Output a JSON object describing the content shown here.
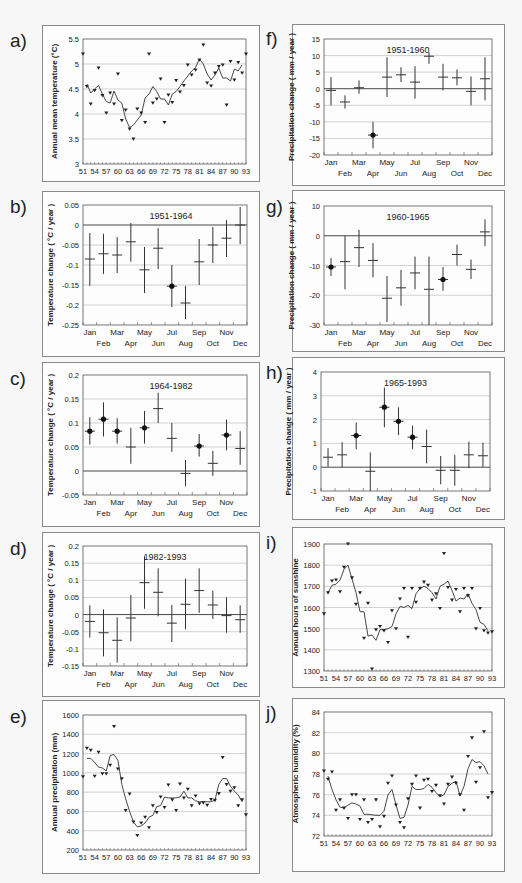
{
  "panel_labels": [
    "a)",
    "b)",
    "c)",
    "d)",
    "e)",
    "f)",
    "g)",
    "h)",
    "i)",
    "j)"
  ],
  "chart_data": [
    {
      "id": "a",
      "type": "scatter+line",
      "title": "",
      "xlabel": "",
      "ylabel": "Annual mean temperature (°C)",
      "ylim": [
        3,
        5.5
      ],
      "yticks": [
        3,
        3.5,
        4,
        4.5,
        5,
        5.5
      ],
      "xticks": [
        "51",
        "54",
        "57",
        "60",
        "63",
        "66",
        "69",
        "72",
        "75",
        "78",
        "81",
        "84",
        "87",
        "90",
        "93"
      ],
      "x": [
        51,
        52,
        53,
        54,
        55,
        56,
        57,
        58,
        59,
        60,
        61,
        62,
        63,
        64,
        65,
        66,
        67,
        68,
        69,
        70,
        71,
        72,
        73,
        74,
        75,
        76,
        77,
        78,
        79,
        80,
        81,
        82,
        83,
        84,
        85,
        86,
        87,
        88,
        89,
        90,
        91,
        92,
        93
      ],
      "points": [
        5.2,
        4.55,
        4.2,
        4.47,
        4.92,
        4.37,
        4.02,
        4.42,
        4.2,
        4.8,
        3.87,
        4.08,
        3.7,
        3.5,
        4.1,
        4.02,
        3.83,
        5.2,
        4.22,
        4.3,
        4.7,
        3.83,
        4.38,
        4.23,
        4.67,
        4.44,
        4.57,
        4.98,
        4.78,
        4.88,
        5.08,
        5.38,
        4.62,
        4.56,
        4.82,
        4.95,
        4.98,
        4.18,
        5.05,
        4.68,
        5.03,
        4.82,
        5.2
      ],
      "smooth": [
        null,
        4.6,
        4.42,
        4.5,
        4.57,
        4.4,
        4.25,
        4.22,
        4.46,
        4.28,
        4.22,
        3.9,
        3.73,
        3.78,
        3.88,
        3.98,
        4.32,
        4.4,
        4.55,
        4.45,
        4.3,
        4.3,
        4.18,
        4.4,
        4.45,
        4.55,
        4.66,
        4.76,
        4.86,
        4.93,
        5.1,
        5.0,
        4.8,
        4.68,
        4.78,
        4.92,
        4.72,
        4.72,
        4.66,
        4.9,
        4.86,
        4.98,
        null
      ],
      "grid": true
    },
    {
      "id": "b",
      "type": "errorbar",
      "title": "1951-1964",
      "ylabel": "Temperature change ( °C / year )",
      "ylim": [
        -0.25,
        0.05
      ],
      "yticks": [
        -0.25,
        -0.2,
        -0.15,
        -0.1,
        -0.05,
        0,
        0.05
      ],
      "categories": [
        "Jan",
        "Feb",
        "Mar",
        "Apr",
        "May",
        "Jun",
        "Jul",
        "Aug",
        "Sep",
        "Oct",
        "Nov",
        "Dec"
      ],
      "values": [
        -0.085,
        -0.072,
        -0.075,
        -0.042,
        -0.112,
        -0.058,
        -0.153,
        -0.195,
        -0.092,
        -0.05,
        -0.033,
        0.0
      ],
      "low": [
        -0.152,
        -0.122,
        -0.12,
        -0.092,
        -0.17,
        -0.11,
        -0.205,
        -0.235,
        -0.15,
        -0.095,
        -0.08,
        -0.048
      ],
      "high": [
        -0.02,
        -0.022,
        -0.03,
        0.005,
        -0.055,
        -0.008,
        -0.1,
        -0.152,
        -0.035,
        -0.005,
        0.012,
        0.045
      ],
      "significant": [
        false,
        false,
        false,
        false,
        false,
        false,
        true,
        false,
        false,
        false,
        false,
        false
      ],
      "grid": true
    },
    {
      "id": "c",
      "type": "errorbar",
      "title": "1964-1982",
      "ylabel": "Temperature change ( °C / year )",
      "ylim": [
        -0.05,
        0.2
      ],
      "yticks": [
        -0.05,
        0,
        0.05,
        0.1,
        0.15,
        0.2
      ],
      "categories": [
        "Jan",
        "Feb",
        "Mar",
        "Apr",
        "May",
        "Jun",
        "Jul",
        "Aug",
        "Sep",
        "Oct",
        "Nov",
        "Dec"
      ],
      "values": [
        0.083,
        0.108,
        0.083,
        0.05,
        0.09,
        0.13,
        0.068,
        -0.005,
        0.052,
        0.016,
        0.075,
        0.047
      ],
      "low": [
        0.055,
        0.072,
        0.057,
        0.015,
        0.057,
        0.1,
        0.04,
        -0.032,
        0.03,
        -0.01,
        0.043,
        0.013
      ],
      "high": [
        0.112,
        0.143,
        0.11,
        0.09,
        0.125,
        0.163,
        0.1,
        0.023,
        0.077,
        0.042,
        0.107,
        0.083
      ],
      "significant": [
        true,
        true,
        true,
        false,
        true,
        false,
        false,
        false,
        true,
        false,
        true,
        false
      ],
      "grid": true
    },
    {
      "id": "d",
      "type": "errorbar",
      "title": "1982-1993",
      "ylabel": "Temperature change ( °C / year )",
      "ylim": [
        -0.15,
        0.2
      ],
      "yticks": [
        -0.15,
        -0.1,
        -0.05,
        0,
        0.05,
        0.1,
        0.15,
        0.2
      ],
      "categories": [
        "Jan",
        "Feb",
        "Mar",
        "Apr",
        "May",
        "Jun",
        "Jul",
        "Aug",
        "Sep",
        "Oct",
        "Nov",
        "Dec"
      ],
      "values": [
        -0.02,
        -0.053,
        -0.075,
        -0.01,
        0.093,
        0.065,
        -0.025,
        0.03,
        0.07,
        0.028,
        -0.003,
        -0.015
      ],
      "low": [
        -0.067,
        -0.122,
        -0.14,
        -0.078,
        0.017,
        -0.005,
        -0.08,
        -0.043,
        0.005,
        -0.013,
        -0.053,
        -0.053
      ],
      "high": [
        0.027,
        0.015,
        -0.008,
        0.057,
        0.17,
        0.135,
        0.028,
        0.105,
        0.135,
        0.07,
        0.05,
        0.027
      ],
      "significant": [
        false,
        false,
        false,
        false,
        false,
        false,
        false,
        false,
        false,
        false,
        false,
        false
      ],
      "grid": true
    },
    {
      "id": "e",
      "type": "scatter+line",
      "ylabel": "Annual precipitation (mm)",
      "ylim": [
        200,
        1600
      ],
      "yticks": [
        200,
        400,
        600,
        800,
        1000,
        1200,
        1400,
        1600
      ],
      "xticks": [
        "51",
        "54",
        "57",
        "60",
        "63",
        "66",
        "69",
        "72",
        "75",
        "78",
        "81",
        "84",
        "87",
        "90",
        "93"
      ],
      "x": [
        51,
        52,
        53,
        54,
        55,
        56,
        57,
        58,
        59,
        60,
        61,
        62,
        63,
        64,
        65,
        66,
        67,
        68,
        69,
        70,
        71,
        72,
        73,
        74,
        75,
        76,
        77,
        78,
        79,
        80,
        81,
        82,
        83,
        84,
        85,
        86,
        87,
        88,
        89,
        90,
        91,
        92,
        93
      ],
      "points": [
        960,
        1255,
        1235,
        965,
        1215,
        990,
        990,
        1080,
        1480,
        1040,
        940,
        610,
        780,
        490,
        350,
        480,
        540,
        430,
        660,
        590,
        750,
        640,
        875,
        720,
        610,
        885,
        740,
        830,
        660,
        760,
        680,
        690,
        665,
        725,
        715,
        785,
        1160,
        880,
        810,
        845,
        660,
        720,
        565
      ],
      "smooth": [
        null,
        1150,
        1150,
        1110,
        1060,
        1050,
        1020,
        1180,
        1190,
        1130,
        880,
        730,
        600,
        490,
        440,
        450,
        480,
        540,
        560,
        650,
        660,
        750,
        740,
        740,
        740,
        750,
        810,
        740,
        740,
        710,
        700,
        700,
        700,
        700,
        720,
        880,
        940,
        940,
        860,
        810,
        770,
        700,
        null
      ],
      "grid": true
    },
    {
      "id": "f",
      "type": "errorbar",
      "title": "1951-1960",
      "ylabel": "Precipitation change ( mm / year )",
      "ylim": [
        -20,
        15
      ],
      "yticks": [
        -20,
        -15,
        -10,
        -5,
        0,
        5,
        10,
        15
      ],
      "categories": [
        "Jan",
        "Feb",
        "Mar",
        "Apr",
        "May",
        "Jun",
        "Jul",
        "Aug",
        "Sep",
        "Oct",
        "Nov",
        "Dec"
      ],
      "values": [
        -0.5,
        -4,
        0.3,
        -14,
        3.5,
        4.2,
        2,
        9.8,
        3.5,
        3.3,
        -0.8,
        3
      ],
      "low": [
        -5,
        -6,
        -1.5,
        -18,
        -2.5,
        2,
        -3,
        7.5,
        -0.5,
        1,
        -5,
        -3.5
      ],
      "high": [
        3.5,
        -2,
        2.5,
        -10,
        9.5,
        6.5,
        6.8,
        11,
        7.5,
        5.8,
        3.7,
        9.5
      ],
      "significant": [
        false,
        false,
        false,
        true,
        false,
        false,
        false,
        false,
        false,
        false,
        false,
        false
      ],
      "grid": true
    },
    {
      "id": "g",
      "type": "errorbar",
      "title": "1960-1965",
      "ylabel": "Precipitation change ( mm / year )",
      "ylim": [
        -30,
        10
      ],
      "yticks": [
        -30,
        -20,
        -10,
        0,
        10
      ],
      "categories": [
        "Jan",
        "Feb",
        "Mar",
        "Apr",
        "May",
        "Jun",
        "Jul",
        "Aug",
        "Sep",
        "Oct",
        "Nov",
        "Dec"
      ],
      "values": [
        -10.5,
        -8.7,
        -4,
        -8.3,
        -21,
        -17.5,
        -12.5,
        -18,
        -14.7,
        -6.3,
        -11.3,
        1.3
      ],
      "low": [
        -13.5,
        -18,
        -10.5,
        -14,
        -29,
        -23.5,
        -18,
        -30,
        -18.5,
        -10,
        -14.5,
        -3.5
      ],
      "high": [
        -7.5,
        0,
        2,
        -2.5,
        -13.5,
        -11.5,
        -7,
        -7,
        -10.5,
        -3,
        -8,
        5.5
      ],
      "significant": [
        true,
        false,
        false,
        false,
        false,
        false,
        false,
        false,
        true,
        false,
        false,
        false
      ],
      "grid": true
    },
    {
      "id": "h",
      "type": "errorbar",
      "title": "1965-1993",
      "ylabel": "Precipitation change ( mm / year )",
      "ylim": [
        -1,
        4
      ],
      "yticks": [
        -1,
        0,
        1,
        2,
        3,
        4
      ],
      "categories": [
        "Jan",
        "Feb",
        "Mar",
        "Apr",
        "May",
        "Jun",
        "Jul",
        "Aug",
        "Sep",
        "Oct",
        "Nov",
        "Dec"
      ],
      "values": [
        0.42,
        0.52,
        1.33,
        -0.17,
        2.52,
        1.93,
        1.26,
        0.87,
        -0.13,
        -0.13,
        0.52,
        0.48
      ],
      "low": [
        0.02,
        0.0,
        0.75,
        -1.0,
        1.68,
        1.35,
        0.76,
        0.16,
        -0.72,
        -0.78,
        -0.04,
        0.02
      ],
      "high": [
        0.8,
        1.05,
        1.88,
        0.62,
        3.35,
        2.52,
        1.75,
        1.58,
        0.47,
        0.52,
        1.07,
        1.03
      ],
      "significant": [
        false,
        false,
        true,
        false,
        true,
        true,
        true,
        false,
        false,
        false,
        false,
        false
      ],
      "grid": true
    },
    {
      "id": "i",
      "type": "scatter+line",
      "ylabel": "Annual hours of sunshine",
      "ylim": [
        1300,
        1900
      ],
      "yticks": [
        1300,
        1400,
        1500,
        1600,
        1700,
        1800,
        1900
      ],
      "xticks": [
        "51",
        "54",
        "57",
        "60",
        "63",
        "66",
        "69",
        "72",
        "75",
        "78",
        "81",
        "84",
        "87",
        "90",
        "93"
      ],
      "x": [
        51,
        52,
        53,
        54,
        55,
        56,
        57,
        58,
        59,
        60,
        61,
        62,
        63,
        64,
        65,
        66,
        67,
        68,
        69,
        70,
        71,
        72,
        73,
        74,
        75,
        76,
        77,
        78,
        79,
        80,
        81,
        82,
        83,
        84,
        85,
        86,
        87,
        88,
        89,
        90,
        91,
        92,
        93
      ],
      "points": [
        1570,
        1670,
        1725,
        1730,
        1675,
        1790,
        1900,
        1740,
        1615,
        1670,
        1455,
        1620,
        1310,
        1495,
        1510,
        1490,
        1435,
        1585,
        1500,
        1640,
        1690,
        1460,
        1690,
        1625,
        1690,
        1720,
        1705,
        1635,
        1665,
        1595,
        1855,
        1695,
        1635,
        1685,
        1580,
        1690,
        1655,
        1690,
        1500,
        1595,
        1490,
        1480,
        1485
      ],
      "smooth": [
        null,
        1670,
        1705,
        1710,
        1730,
        1780,
        1800,
        1735,
        1670,
        1580,
        1580,
        1465,
        1470,
        1445,
        1495,
        1495,
        1500,
        1510,
        1570,
        1605,
        1600,
        1610,
        1595,
        1665,
        1690,
        1700,
        1690,
        1670,
        1640,
        1700,
        1710,
        1725,
        1680,
        1630,
        1645,
        1640,
        1665,
        1620,
        1590,
        1530,
        1520,
        1490,
        null
      ],
      "grid": true
    },
    {
      "id": "j",
      "type": "scatter+line",
      "ylabel": "Atmospheric humidity (%)",
      "ylim": [
        72,
        84
      ],
      "yticks": [
        72,
        74,
        76,
        78,
        80,
        82,
        84
      ],
      "xticks": [
        "51",
        "54",
        "57",
        "60",
        "63",
        "66",
        "69",
        "72",
        "75",
        "78",
        "81",
        "84",
        "87",
        "90",
        "93"
      ],
      "x": [
        51,
        52,
        53,
        54,
        55,
        56,
        57,
        58,
        59,
        60,
        61,
        62,
        63,
        64,
        65,
        66,
        67,
        68,
        69,
        70,
        71,
        72,
        73,
        74,
        75,
        76,
        77,
        78,
        79,
        80,
        81,
        82,
        83,
        84,
        85,
        86,
        87,
        88,
        89,
        90,
        91,
        92,
        93
      ],
      "points": [
        78.3,
        77.5,
        78.2,
        74.5,
        75.5,
        74.7,
        73.7,
        76,
        76,
        73.6,
        75.5,
        73.3,
        73.6,
        75.5,
        72.9,
        73.9,
        77.1,
        77.8,
        75,
        73.3,
        72.8,
        75.6,
        77,
        77.8,
        74.7,
        77.4,
        77.5,
        76.3,
        76.9,
        75.9,
        75.1,
        77,
        77.7,
        77.1,
        76,
        74.5,
        79.7,
        81.5,
        77.2,
        78.6,
        82.1,
        75.7,
        76.2
      ],
      "smooth": [
        null,
        77.8,
        76.5,
        75.5,
        74.8,
        74.7,
        75,
        75.2,
        75.1,
        74.9,
        74.1,
        74.1,
        74.05,
        74.0,
        74.0,
        74.4,
        76,
        76.5,
        75,
        73.7,
        73.8,
        75,
        76.8,
        76.5,
        76.5,
        76.6,
        77,
        76.7,
        76.2,
        75.8,
        76,
        76.8,
        77.1,
        77.3,
        75.9,
        76.8,
        78.5,
        79.4,
        79.1,
        79.2,
        78.8,
        78,
        null
      ],
      "grid": true
    }
  ],
  "layout": {
    "frames": [
      {
        "id": "a",
        "x": 42,
        "y": 25,
        "w": 218,
        "h": 157,
        "label_x": 10,
        "label_y": 48
      },
      {
        "id": "b",
        "x": 42,
        "y": 191,
        "w": 218,
        "h": 166,
        "label_x": 10,
        "label_y": 214
      },
      {
        "id": "c",
        "x": 42,
        "y": 362,
        "w": 218,
        "h": 165,
        "label_x": 10,
        "label_y": 386
      },
      {
        "id": "d",
        "x": 42,
        "y": 532,
        "w": 218,
        "h": 165,
        "label_x": 10,
        "label_y": 556
      },
      {
        "id": "e",
        "x": 42,
        "y": 700,
        "w": 218,
        "h": 174,
        "label_x": 10,
        "label_y": 724
      },
      {
        "id": "f",
        "x": 292,
        "y": 24,
        "w": 213,
        "h": 162,
        "label_x": 266,
        "label_y": 46
      },
      {
        "id": "g",
        "x": 292,
        "y": 190,
        "w": 213,
        "h": 162,
        "label_x": 266,
        "label_y": 214
      },
      {
        "id": "h",
        "x": 292,
        "y": 357,
        "w": 213,
        "h": 163,
        "label_x": 266,
        "label_y": 380
      },
      {
        "id": "i",
        "x": 292,
        "y": 527,
        "w": 213,
        "h": 161,
        "label_x": 266,
        "label_y": 550
      },
      {
        "id": "j",
        "x": 292,
        "y": 698,
        "w": 213,
        "h": 174,
        "label_x": 266,
        "label_y": 720
      }
    ],
    "plots": {
      "a": {
        "x": 83,
        "y": 39,
        "w": 163,
        "h": 125
      },
      "b": {
        "x": 83,
        "y": 205,
        "w": 164,
        "h": 120
      },
      "c": {
        "x": 83,
        "y": 375,
        "w": 164,
        "h": 120
      },
      "d": {
        "x": 83,
        "y": 546,
        "w": 164,
        "h": 120
      },
      "e": {
        "x": 83,
        "y": 715,
        "w": 163,
        "h": 135
      },
      "f": {
        "x": 324,
        "y": 39,
        "w": 168,
        "h": 116
      },
      "g": {
        "x": 324,
        "y": 206,
        "w": 168,
        "h": 119
      },
      "h": {
        "x": 321,
        "y": 372,
        "w": 169,
        "h": 119
      },
      "i": {
        "x": 324,
        "y": 544,
        "w": 168,
        "h": 127
      },
      "j": {
        "x": 324,
        "y": 712,
        "w": 168,
        "h": 124
      }
    }
  }
}
